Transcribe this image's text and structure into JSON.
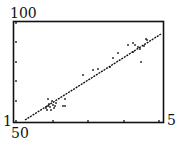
{
  "labels": {
    "y_top": "100",
    "y_bottom": "1",
    "x_left": "50",
    "x_right": "5"
  },
  "chart_data": {
    "type": "scatter",
    "title": "",
    "xlabel": "",
    "ylabel": "",
    "window_labels": {
      "top_left": "100",
      "bottom_left": "1",
      "below_left": "50",
      "bottom_right": "5"
    },
    "grid": false,
    "frame": {
      "x0": 13,
      "y0": 21,
      "x1": 164,
      "y1": 122
    },
    "points_px": [
      [
        16,
        23
      ],
      [
        16,
        42
      ],
      [
        16,
        62
      ],
      [
        16,
        81
      ],
      [
        16,
        101
      ],
      [
        16,
        121
      ],
      [
        53,
        121
      ],
      [
        88,
        121
      ],
      [
        124,
        121
      ],
      [
        159,
        121
      ],
      [
        46,
        108
      ],
      [
        48,
        106
      ],
      [
        49,
        104
      ],
      [
        47,
        110
      ],
      [
        50,
        107
      ],
      [
        51,
        110
      ],
      [
        53,
        105
      ],
      [
        54,
        108
      ],
      [
        56,
        103
      ],
      [
        48,
        99
      ],
      [
        52,
        101
      ],
      [
        55,
        106
      ],
      [
        63,
        106
      ],
      [
        65,
        106
      ],
      [
        65,
        99
      ],
      [
        83,
        75
      ],
      [
        93,
        70
      ],
      [
        98,
        69
      ],
      [
        110,
        67
      ],
      [
        113,
        58
      ],
      [
        118,
        53
      ],
      [
        128,
        45
      ],
      [
        133,
        43
      ],
      [
        133,
        52
      ],
      [
        135,
        45
      ],
      [
        138,
        47
      ],
      [
        140,
        49
      ],
      [
        141,
        62
      ],
      [
        144,
        46
      ],
      [
        146,
        39
      ],
      [
        147,
        40
      ]
    ],
    "regression_line_px": [
      [
        25,
        120
      ],
      [
        161,
        34
      ]
    ],
    "series": [
      {
        "name": "data",
        "type": "scatter"
      },
      {
        "name": "fit",
        "type": "line"
      }
    ]
  }
}
